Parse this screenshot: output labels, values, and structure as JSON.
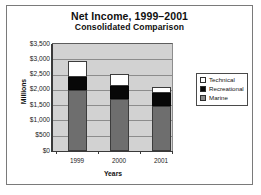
{
  "chart_data": {
    "type": "bar",
    "stacked": true,
    "title": "Net Income, 1999–2001",
    "subtitle": "Consolidated Comparison",
    "xlabel": "Years",
    "ylabel": "Millions",
    "categories": [
      "1999",
      "2000",
      "2001"
    ],
    "ylim": [
      0,
      3500
    ],
    "ytick_labels": [
      "$3,500",
      "$3,000",
      "$2,500",
      "$2,000",
      "$1,500",
      "$1,000",
      "$500",
      "$0"
    ],
    "ytick_values": [
      3500,
      3000,
      2500,
      2000,
      1500,
      1000,
      500,
      0
    ],
    "grid": true,
    "legend_position": "right",
    "series": [
      {
        "name": "Marine",
        "color": "#6e6e6e",
        "values": [
          2000,
          1700,
          1470
        ]
      },
      {
        "name": "Recreational",
        "color": "#080808",
        "values": [
          430,
          420,
          430
        ]
      },
      {
        "name": "Technical",
        "color": "#ffffff",
        "values": [
          520,
          390,
          190
        ]
      }
    ],
    "cumulative_tops": {
      "1999": {
        "marine": 2000,
        "recreational": 2430,
        "technical": 2950
      },
      "2000": {
        "marine": 1700,
        "recreational": 2120,
        "technical": 2510
      },
      "2001": {
        "marine": 1470,
        "recreational": 1900,
        "technical": 2090
      }
    },
    "totals": [
      2950,
      2510,
      2090
    ]
  },
  "legend": {
    "items": [
      {
        "label": "Technical"
      },
      {
        "label": "Recreational"
      },
      {
        "label": "Marine"
      }
    ]
  }
}
